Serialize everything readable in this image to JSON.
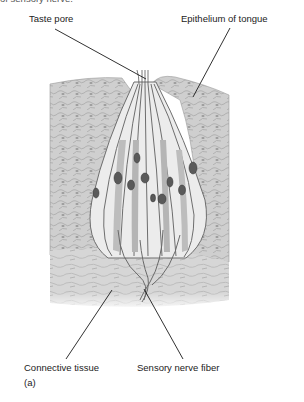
{
  "figure": {
    "partial_top_text": "of sensory nerve.",
    "panel_label": "(a)",
    "labels": {
      "taste_pore": "Taste pore",
      "epithelium": "Epithelium of tongue",
      "connective_tissue": "Connective tissue",
      "sensory_nerve_fiber": "Sensory nerve fiber"
    }
  },
  "colors": {
    "background": "#ffffff",
    "tissue": "#c9c9c9",
    "tissue_dark": "#9a9a9a",
    "cell_light": "#ececec",
    "cell_outline": "#6e6e6e",
    "nucleus": "#5a5a5a",
    "leader_line": "#1a1a1a"
  }
}
